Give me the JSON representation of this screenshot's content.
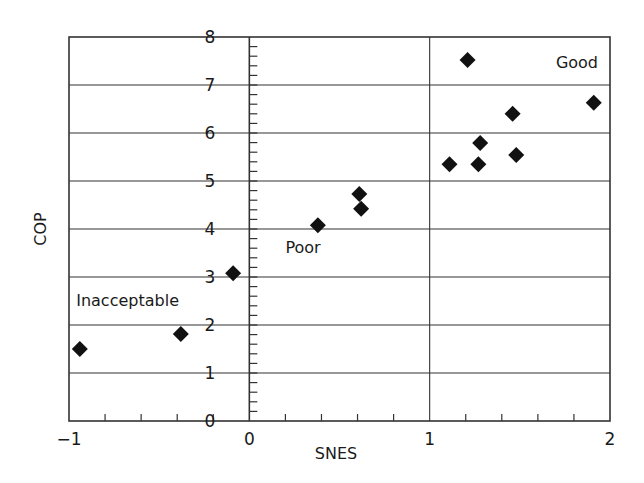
{
  "chart_data": {
    "type": "scatter",
    "title": "",
    "xlabel": "SNES",
    "ylabel": "COP",
    "xlim": [
      -1,
      2
    ],
    "ylim": [
      0,
      8
    ],
    "x_ticks": [
      "-1",
      "0",
      "1",
      "2"
    ],
    "y_ticks": [
      "0",
      "1",
      "2",
      "3",
      "4",
      "5",
      "6",
      "7",
      "8"
    ],
    "x_minor_step": 0.2,
    "y_minor_step": 0.2,
    "grid": {
      "horizontal": true,
      "vertical_at": [
        1
      ]
    },
    "legend": null,
    "marker": "diamond",
    "marker_color": "#111111",
    "series": [
      {
        "name": "data",
        "points": [
          {
            "x": -0.94,
            "y": 1.5
          },
          {
            "x": -0.38,
            "y": 1.81
          },
          {
            "x": -0.09,
            "y": 3.08
          },
          {
            "x": 0.38,
            "y": 4.08
          },
          {
            "x": 0.61,
            "y": 4.73
          },
          {
            "x": 0.62,
            "y": 4.42
          },
          {
            "x": 1.11,
            "y": 5.35
          },
          {
            "x": 1.27,
            "y": 5.35
          },
          {
            "x": 1.28,
            "y": 5.79
          },
          {
            "x": 1.48,
            "y": 5.54
          },
          {
            "x": 1.46,
            "y": 6.4
          },
          {
            "x": 1.21,
            "y": 7.52
          },
          {
            "x": 1.91,
            "y": 6.63
          }
        ]
      }
    ],
    "annotations": [
      {
        "text": "Inacceptable",
        "x": -0.96,
        "y": 2.4
      },
      {
        "text": "Poor",
        "x": 0.2,
        "y": 3.5
      },
      {
        "text": "Good",
        "x": 1.7,
        "y": 7.35
      }
    ]
  },
  "labels": {
    "x_axis_title": "SNES",
    "y_axis_title": "COP",
    "region_inacceptable": "Inacceptable",
    "region_poor": "Poor",
    "region_good": "Good"
  }
}
